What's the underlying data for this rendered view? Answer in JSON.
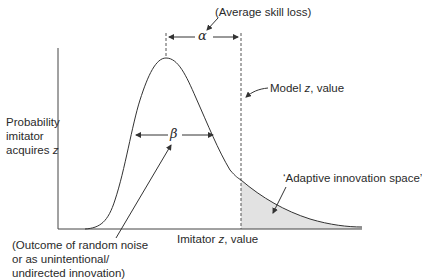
{
  "diagram": {
    "y_axis_label": {
      "line1": "Probability",
      "line2": "imitator",
      "line3_prefix": "acquires ",
      "line3_var": "z"
    },
    "x_axis_label": {
      "prefix": "Imitator ",
      "var": "z",
      "suffix": ", value"
    },
    "model_label": {
      "prefix": "Model ",
      "var": "z",
      "suffix": ", value"
    },
    "alpha_symbol": "α",
    "alpha_annotation": "(Average skill loss)",
    "beta_symbol": "β",
    "beta_annotation": {
      "line1": "(Outcome of random noise",
      "line2": "or as unintentional/",
      "line3": "undirected innovation)"
    },
    "shaded_region_label": "‘Adaptive innovation space’",
    "colors": {
      "line": "#333333",
      "shade": "#e2e2e2"
    }
  }
}
